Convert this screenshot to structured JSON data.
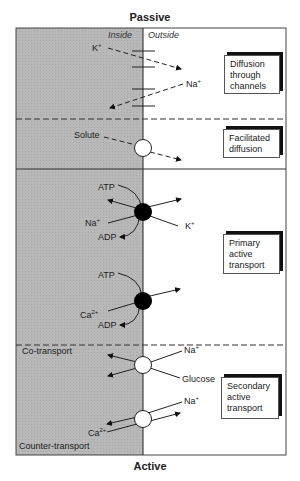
{
  "header": {
    "top_label": "Passive",
    "bottom_label": "Active"
  },
  "regions": {
    "inside_label": "Inside",
    "outside_label": "Outside"
  },
  "colors": {
    "inside_fill": "#b8b8b8",
    "pump_fill": "#000000",
    "carrier_fill": "#ffffff",
    "line": "#222222"
  },
  "sections": [
    {
      "name": "Diffusion through channels",
      "lines": [
        "Diffusion",
        "through",
        "channels"
      ],
      "labels": {
        "ion_out": "K",
        "ion_out_sup": "+",
        "ion_in": "Na",
        "ion_in_sup": "+"
      }
    },
    {
      "name": "Facilitated diffusion",
      "lines": [
        "Facilitated",
        "diffusion"
      ],
      "labels": {
        "solute": "Solute"
      }
    },
    {
      "name": "Primary active transport",
      "lines": [
        "Primary",
        "active",
        "transport"
      ],
      "labels": {
        "pump1_atp": "ATP",
        "pump1_adp": "ADP",
        "pump1_na": "Na",
        "pump1_na_sup": "+",
        "pump1_k": "K",
        "pump1_k_sup": "+",
        "pump2_atp": "ATP",
        "pump2_adp": "ADP",
        "pump2_ca": "Ca",
        "pump2_ca_sup": "2+"
      }
    },
    {
      "name": "Secondary active transport",
      "lines": [
        "Secondary",
        "active",
        "transport"
      ],
      "labels": {
        "cotransport": "Co-transport",
        "co_na": "Na",
        "co_na_sup": "+",
        "co_glucose": "Glucose",
        "counter_na": "Na",
        "counter_na_sup": "+",
        "counter_ca": "Ca",
        "counter_ca_sup": "2+",
        "countertransport": "Counter-transport"
      }
    }
  ]
}
